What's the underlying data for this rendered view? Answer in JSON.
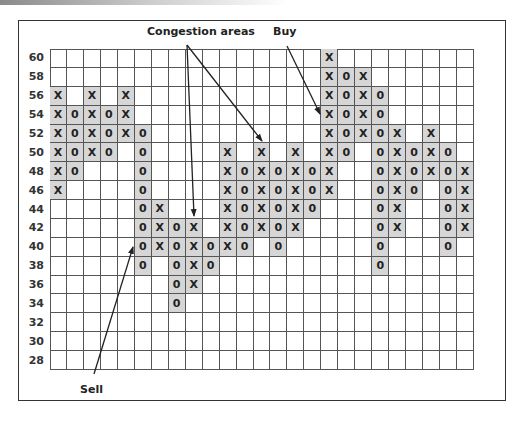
{
  "chart_data": {
    "type": "point-and-figure",
    "title": "",
    "xlabel": "",
    "ylabel": "",
    "y_ticks": [
      60,
      58,
      56,
      54,
      52,
      50,
      48,
      46,
      44,
      42,
      40,
      38,
      36,
      34,
      32,
      30,
      28
    ],
    "box_size": 2,
    "ylim": [
      28,
      60
    ],
    "grid": true,
    "num_columns": 25,
    "columns": [
      {
        "col": 1,
        "symbol": "X",
        "high": 56,
        "low": 46
      },
      {
        "col": 2,
        "symbol": "O",
        "high": 54,
        "low": 48
      },
      {
        "col": 3,
        "symbol": "X",
        "high": 56,
        "low": 50
      },
      {
        "col": 4,
        "symbol": "O",
        "high": 54,
        "low": 50
      },
      {
        "col": 5,
        "symbol": "X",
        "high": 56,
        "low": 52
      },
      {
        "col": 6,
        "symbol": "O",
        "high": 52,
        "low": 38
      },
      {
        "col": 7,
        "symbol": "X",
        "high": 44,
        "low": 40
      },
      {
        "col": 8,
        "symbol": "O",
        "high": 42,
        "low": 34
      },
      {
        "col": 9,
        "symbol": "X",
        "high": 42,
        "low": 36
      },
      {
        "col": 10,
        "symbol": "O",
        "high": 40,
        "low": 38
      },
      {
        "col": 11,
        "symbol": "X",
        "high": 50,
        "low": 40
      },
      {
        "col": 12,
        "symbol": "O",
        "high": 48,
        "low": 40
      },
      {
        "col": 13,
        "symbol": "X",
        "high": 50,
        "low": 42
      },
      {
        "col": 14,
        "symbol": "O",
        "high": 48,
        "low": 40
      },
      {
        "col": 15,
        "symbol": "X",
        "high": 50,
        "low": 42
      },
      {
        "col": 16,
        "symbol": "O",
        "high": 48,
        "low": 44
      },
      {
        "col": 17,
        "symbol": "X",
        "high": 60,
        "low": 46
      },
      {
        "col": 18,
        "symbol": "O",
        "high": 58,
        "low": 50
      },
      {
        "col": 19,
        "symbol": "X",
        "high": 58,
        "low": 52
      },
      {
        "col": 20,
        "symbol": "O",
        "high": 56,
        "low": 38
      },
      {
        "col": 21,
        "symbol": "X",
        "high": 52,
        "low": 42
      },
      {
        "col": 22,
        "symbol": "O",
        "high": 50,
        "low": 46
      },
      {
        "col": 23,
        "symbol": "X",
        "high": 52,
        "low": 48
      },
      {
        "col": 24,
        "symbol": "O",
        "high": 50,
        "low": 40
      },
      {
        "col": 25,
        "symbol": "X",
        "high": 48,
        "low": 42
      }
    ],
    "annotations": [
      {
        "text": "Congestion areas",
        "points_to": [
          {
            "col": 9,
            "value": 42
          },
          {
            "col": 13,
            "value": 50
          }
        ]
      },
      {
        "text": "Buy",
        "points_to": [
          {
            "col": 17,
            "value": 52
          }
        ]
      },
      {
        "text": "Sell",
        "points_to": [
          {
            "col": 6,
            "value": 40
          }
        ]
      }
    ]
  },
  "labels": {
    "congestion": "Congestion areas",
    "buy": "Buy",
    "sell": "Sell"
  },
  "symbols": {
    "X": "X",
    "O": "0"
  },
  "colors": {
    "fill": "#d6d6d6",
    "grid": "#555555",
    "text": "#222222"
  }
}
